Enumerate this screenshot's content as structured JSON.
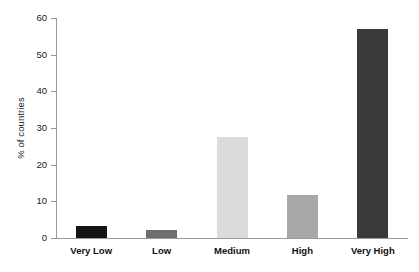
{
  "chart_data": {
    "type": "bar",
    "title": "",
    "subtitle": "",
    "xlabel": "",
    "ylabel": "% of countries",
    "categories": [
      "Very Low",
      "Low",
      "Medium",
      "High",
      "Very High"
    ],
    "values": [
      3.3,
      2.3,
      27.5,
      11.7,
      57.0
    ],
    "series": [
      {
        "name": "% of countries",
        "values": [
          3.3,
          2.3,
          27.5,
          11.7,
          57.0
        ]
      }
    ],
    "bar_colors": [
      "#141414",
      "#6e6e6e",
      "#dcdcdc",
      "#a8a8a8",
      "#3a3a3a"
    ],
    "ylim": [
      0,
      60
    ],
    "yticks": [
      0,
      10,
      20,
      30,
      40,
      50,
      60
    ],
    "ytick_labels": [
      "0",
      "10",
      "20",
      "30",
      "40",
      "50",
      "60"
    ],
    "grid": false,
    "legend": false,
    "legend_position": "none",
    "axis_color": "#9a9a9a",
    "text_color": "#111111",
    "background": "#ffffff"
  }
}
